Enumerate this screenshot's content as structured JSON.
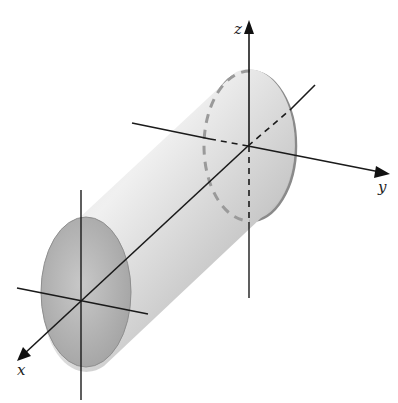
{
  "figure": {
    "axes": {
      "x": {
        "label": "x"
      },
      "y": {
        "label": "y"
      },
      "z": {
        "label": "z"
      }
    },
    "colors": {
      "axis": "#1a1a1a",
      "cylinder_light": "#e6e6e6",
      "cylinder_mid": "#c4c4c4",
      "cylinder_dark": "#9c9c9c",
      "ellipse_edge": "#8a8a8a",
      "hidden_dash": "#9a9a9a"
    }
  }
}
